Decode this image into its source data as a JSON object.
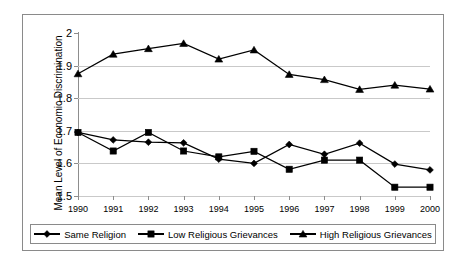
{
  "chart_data": {
    "type": "line",
    "title": "",
    "xlabel": "",
    "ylabel": "Mean Level of Economic Discrimination",
    "categories": [
      "1990",
      "1991",
      "1992",
      "1993",
      "1994",
      "1995",
      "1996",
      "1997",
      "1998",
      "1999",
      "2000"
    ],
    "ylim": [
      1.5,
      2.0
    ],
    "yticks": [
      "1.5",
      "1.6",
      "1.7",
      "1.8",
      "1.9",
      "2"
    ],
    "ytick_values": [
      1.5,
      1.6,
      1.7,
      1.8,
      1.9,
      2.0
    ],
    "grid": true,
    "legend_position": "bottom",
    "series": [
      {
        "name": "Same Religion",
        "marker": "diamond",
        "color": "#000000",
        "values": [
          1.695,
          1.672,
          1.665,
          1.663,
          1.613,
          1.6,
          1.658,
          1.628,
          1.662,
          1.598,
          1.58
        ]
      },
      {
        "name": "Low Religious Grievances",
        "marker": "square",
        "color": "#000000",
        "values": [
          1.695,
          1.638,
          1.695,
          1.638,
          1.62,
          1.637,
          1.582,
          1.61,
          1.61,
          1.527,
          1.527
        ]
      },
      {
        "name": "High Religious Grievances",
        "marker": "triangle",
        "color": "#000000",
        "values": [
          1.875,
          1.935,
          1.952,
          1.968,
          1.92,
          1.948,
          1.873,
          1.857,
          1.827,
          1.84,
          1.828
        ]
      }
    ]
  },
  "axis": {
    "y_title": "Mean Level of Economic Discrimination"
  },
  "legend": {
    "items": [
      {
        "label": "Same Religion",
        "marker": "diamond-marker-icon"
      },
      {
        "label": "Low Religious Grievances",
        "marker": "square-marker-icon"
      },
      {
        "label": "High Religious Grievances",
        "marker": "triangle-marker-icon"
      }
    ]
  }
}
